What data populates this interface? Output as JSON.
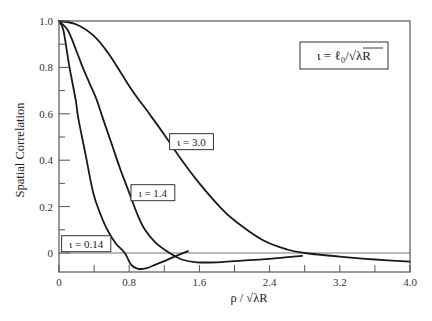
{
  "chart_data": {
    "type": "line",
    "title": "",
    "xlabel": "ρ / √λR",
    "ylabel": "Spatial Correlation",
    "xlim": [
      0,
      4.0
    ],
    "ylim": [
      -0.082,
      1.0
    ],
    "grid": false,
    "x_ticks": [
      0,
      0.8,
      1.6,
      2.4,
      3.2,
      4.0
    ],
    "x_tick_labels": [
      "0",
      "0.8",
      "1.6",
      "2.4",
      "3.2",
      "4.0"
    ],
    "x_minor_ticks": [
      0.4,
      1.2,
      2.0,
      2.8,
      3.6
    ],
    "y_ticks": [
      0,
      0.2,
      0.4,
      0.6,
      0.8,
      1.0
    ],
    "y_tick_labels": [
      "0",
      "0.2",
      "0.4",
      "0.6",
      "0.8",
      "1.0"
    ],
    "y_minor_ticks": [
      0.1,
      0.3,
      0.5,
      0.7,
      0.9
    ],
    "reference_line": {
      "y": 0
    },
    "legend": {
      "text": "ι = ℓ₀/√λR",
      "position": "upper right",
      "x": 3.25,
      "y": 0.85
    },
    "series": [
      {
        "name": "ι = 0.14",
        "label_pos": {
          "x": 0.31,
          "y": 0.04
        },
        "points": [
          [
            0,
            1.0
          ],
          [
            0.05,
            0.96
          ],
          [
            0.12,
            0.8
          ],
          [
            0.19,
            0.66
          ],
          [
            0.22,
            0.58
          ],
          [
            0.3,
            0.43
          ],
          [
            0.39,
            0.26
          ],
          [
            0.47,
            0.17
          ],
          [
            0.55,
            0.1
          ],
          [
            0.65,
            0.04
          ],
          [
            0.75,
            0.0
          ],
          [
            0.82,
            -0.05
          ],
          [
            0.9,
            -0.068
          ],
          [
            1.0,
            -0.065
          ],
          [
            1.1,
            -0.05
          ],
          [
            1.2,
            -0.035
          ],
          [
            1.35,
            -0.01
          ],
          [
            1.47,
            0.008
          ]
        ]
      },
      {
        "name": "ι = 1.4",
        "label_pos": {
          "x": 1.07,
          "y": 0.26
        },
        "points": [
          [
            0,
            1.0
          ],
          [
            0.1,
            0.96
          ],
          [
            0.2,
            0.87
          ],
          [
            0.27,
            0.8
          ],
          [
            0.35,
            0.73
          ],
          [
            0.43,
            0.66
          ],
          [
            0.5,
            0.58
          ],
          [
            0.6,
            0.47
          ],
          [
            0.7,
            0.36
          ],
          [
            0.79,
            0.27
          ],
          [
            0.9,
            0.16
          ],
          [
            0.98,
            0.1
          ],
          [
            1.1,
            0.045
          ],
          [
            1.26,
            0.0
          ],
          [
            1.4,
            -0.028
          ],
          [
            1.57,
            -0.04
          ],
          [
            1.8,
            -0.04
          ],
          [
            2.0,
            -0.035
          ],
          [
            2.4,
            -0.025
          ],
          [
            2.77,
            -0.012
          ]
        ]
      },
      {
        "name": "ι = 3.0",
        "label_pos": {
          "x": 1.51,
          "y": 0.48
        },
        "points": [
          [
            0,
            1.0
          ],
          [
            0.2,
            0.985
          ],
          [
            0.4,
            0.935
          ],
          [
            0.56,
            0.862
          ],
          [
            0.7,
            0.78
          ],
          [
            0.8,
            0.72
          ],
          [
            0.9,
            0.665
          ],
          [
            1.0,
            0.615
          ],
          [
            1.2,
            0.51
          ],
          [
            1.4,
            0.4
          ],
          [
            1.6,
            0.3
          ],
          [
            1.83,
            0.2
          ],
          [
            2.0,
            0.14
          ],
          [
            2.32,
            0.056
          ],
          [
            2.6,
            0.015
          ],
          [
            2.8,
            0.0
          ],
          [
            3.2,
            -0.016
          ],
          [
            3.6,
            -0.028
          ],
          [
            4.0,
            -0.037
          ]
        ]
      }
    ]
  }
}
